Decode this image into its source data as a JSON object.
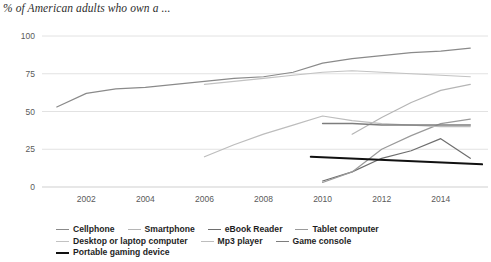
{
  "chart_data": {
    "type": "line",
    "title": "% of American adults who own a ...",
    "xlabel": "",
    "ylabel": "",
    "xlim": [
      2000.5,
      2015.6
    ],
    "ylim": [
      0,
      100
    ],
    "grid": true,
    "grid_axis": "y",
    "legend_position": "bottom",
    "yticks": [
      "0",
      "25",
      "50",
      "75",
      "100"
    ],
    "ytick_values": [
      0,
      25,
      50,
      75,
      100
    ],
    "xticks": [
      "2002",
      "2004",
      "2006",
      "2008",
      "2010",
      "2012",
      "2014"
    ],
    "xtick_values": [
      2002,
      2004,
      2006,
      2008,
      2010,
      2012,
      2014
    ],
    "series": [
      {
        "name": "Cellphone",
        "color": "#8a8a8a",
        "width": 1.2,
        "x": [
          2001,
          2002,
          2003,
          2004,
          2005,
          2006,
          2007,
          2008,
          2009,
          2010,
          2011,
          2012,
          2013,
          2014,
          2015
        ],
        "values": [
          53,
          62,
          65,
          66,
          68,
          70,
          72,
          73,
          76,
          82,
          85,
          87,
          89,
          90,
          92
        ]
      },
      {
        "name": "Smartphone",
        "color": "#b5b5b5",
        "width": 1.2,
        "x": [
          2011,
          2012,
          2013,
          2014,
          2015
        ],
        "values": [
          35,
          46,
          56,
          64,
          68
        ]
      },
      {
        "name": "eBook Reader",
        "color": "#6e6e6e",
        "width": 1.2,
        "x": [
          2010,
          2011,
          2012,
          2013,
          2014,
          2015
        ],
        "values": [
          4,
          10,
          19,
          24,
          32,
          19
        ]
      },
      {
        "name": "Tablet computer",
        "color": "#9a9a9a",
        "width": 1.2,
        "x": [
          2010,
          2011,
          2012,
          2013,
          2014,
          2015
        ],
        "values": [
          3,
          10,
          25,
          34,
          42,
          45
        ]
      },
      {
        "name": "Desktop or laptop computer",
        "color": "#c2c2c2",
        "width": 1.2,
        "x": [
          2006,
          2007,
          2008,
          2009,
          2010,
          2011,
          2012,
          2013,
          2014,
          2015
        ],
        "values": [
          68,
          70,
          72,
          74,
          76,
          77,
          76,
          75,
          74,
          73
        ]
      },
      {
        "name": "Mp3 player",
        "color": "#bdbdbd",
        "width": 1.2,
        "x": [
          2006,
          2007,
          2008,
          2009,
          2010,
          2011,
          2012,
          2013,
          2014,
          2015
        ],
        "values": [
          20,
          28,
          35,
          41,
          47,
          44,
          42,
          41,
          40,
          40
        ]
      },
      {
        "name": "Game console",
        "color": "#7d7d7d",
        "width": 1.5,
        "x": [
          2010,
          2011,
          2012,
          2013,
          2014,
          2015
        ],
        "values": [
          42,
          42,
          41,
          41,
          41,
          41
        ]
      },
      {
        "name": "Portable gaming device",
        "color": "#111111",
        "width": 2.0,
        "x": [
          2009.6,
          2015.4
        ],
        "values": [
          20,
          15
        ]
      }
    ]
  },
  "legend": {
    "rows": [
      [
        {
          "label": "Cellphone",
          "color": "#8a8a8a",
          "width": 1.2
        },
        {
          "label": "Smartphone",
          "color": "#b5b5b5",
          "width": 1.2
        },
        {
          "label": "eBook Reader",
          "color": "#6e6e6e",
          "width": 1.2
        },
        {
          "label": "Tablet computer",
          "color": "#9a9a9a",
          "width": 1.2
        }
      ],
      [
        {
          "label": "Desktop or laptop computer",
          "color": "#c2c2c2",
          "width": 1.2
        },
        {
          "label": "Mp3 player",
          "color": "#bdbdbd",
          "width": 1.2
        },
        {
          "label": "Game console",
          "color": "#7d7d7d",
          "width": 1.5
        }
      ],
      [
        {
          "label": "Portable gaming device",
          "color": "#111111",
          "width": 2.4
        }
      ]
    ]
  },
  "style": {
    "grid_color": "#e2e2e2",
    "axis_color": "#cfcfcf",
    "tick_text_color": "#5a5a5a",
    "title_color": "#2e2e2e",
    "background": "#ffffff"
  }
}
